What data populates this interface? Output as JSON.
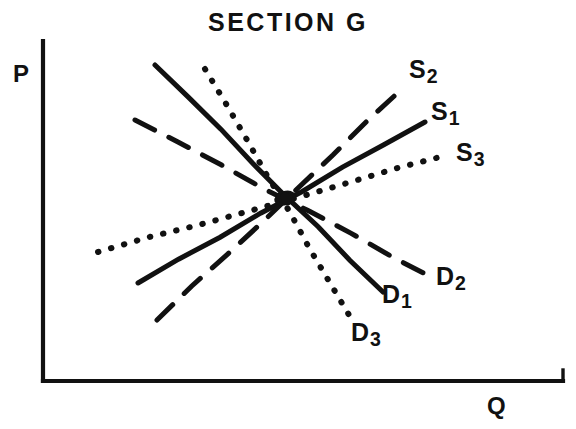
{
  "chart_data": {
    "type": "line",
    "title": "SECTION G",
    "xlabel": "Q",
    "ylabel": "P",
    "grid": false,
    "legend": "inline-end-labels",
    "axes": {
      "x_axis": {
        "x1": 43,
        "y1": 381,
        "x2": 563,
        "y2": 381
      },
      "y_axis": {
        "x1": 43,
        "y1": 41,
        "x2": 43,
        "y2": 381
      }
    },
    "equilibrium": {
      "x": 285,
      "y": 198,
      "label": ""
    },
    "series": [
      {
        "name": "S1",
        "label": "S",
        "subscript": "1",
        "kind": "supply",
        "style": "solid",
        "slope_sign": "positive",
        "x": [
          138,
          425
        ],
        "y": [
          283,
          122
        ]
      },
      {
        "name": "S2",
        "label": "S",
        "subscript": "2",
        "kind": "supply",
        "style": "dashed",
        "slope_sign": "positive",
        "x": [
          157,
          403
        ],
        "y": [
          320,
          88
        ]
      },
      {
        "name": "S3",
        "label": "S",
        "subscript": "3",
        "kind": "supply",
        "style": "dotted",
        "slope_sign": "positive",
        "x": [
          98,
          448
        ],
        "y": [
          252,
          155
        ]
      },
      {
        "name": "D1",
        "label": "D",
        "subscript": "1",
        "kind": "demand",
        "style": "solid",
        "slope_sign": "negative",
        "x": [
          155,
          383
        ],
        "y": [
          65,
          292
        ]
      },
      {
        "name": "D2",
        "label": "D",
        "subscript": "2",
        "kind": "demand",
        "style": "dashed",
        "slope_sign": "negative",
        "x": [
          135,
          437
        ],
        "y": [
          120,
          280
        ]
      },
      {
        "name": "D3",
        "label": "D",
        "subscript": "3",
        "kind": "demand",
        "style": "dotted",
        "slope_sign": "negative",
        "x": [
          205,
          352
        ],
        "y": [
          69,
          320
        ]
      }
    ],
    "colors": {
      "ink": "#111111",
      "background": "#ffffff"
    }
  },
  "title": {
    "text": "SECTION G"
  },
  "axis": {
    "price_label": "P",
    "quantity_label": "Q"
  },
  "labels": {
    "s1": {
      "base": "S",
      "sub": "1"
    },
    "s2": {
      "base": "S",
      "sub": "2"
    },
    "s3": {
      "base": "S",
      "sub": "3"
    },
    "d1": {
      "base": "D",
      "sub": "1"
    },
    "d2": {
      "base": "D",
      "sub": "2"
    },
    "d3": {
      "base": "D",
      "sub": "3"
    }
  }
}
